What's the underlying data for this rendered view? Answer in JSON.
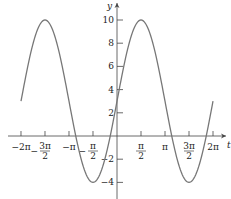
{
  "chart_data": {
    "type": "line",
    "title": "",
    "function": "y = 3 + 7 sin(t)",
    "xlabel": "t",
    "ylabel": "y",
    "xlim": [
      -6.2832,
      6.2832
    ],
    "ylim": [
      -5,
      10.5
    ],
    "grid": false,
    "x_ticks": [
      {
        "value": -6.2832,
        "label": "−2π"
      },
      {
        "value": -4.7124,
        "label": "−3π/2"
      },
      {
        "value": -3.1416,
        "label": "−π"
      },
      {
        "value": -1.5708,
        "label": "−π/2"
      },
      {
        "value": 1.5708,
        "label": "π/2"
      },
      {
        "value": 3.1416,
        "label": "π"
      },
      {
        "value": 4.7124,
        "label": "3π/2"
      },
      {
        "value": 6.2832,
        "label": "2π"
      }
    ],
    "y_ticks": [
      {
        "value": 10,
        "label": "10"
      },
      {
        "value": 8,
        "label": "8"
      },
      {
        "value": 6,
        "label": "6"
      },
      {
        "value": 4,
        "label": "4"
      },
      {
        "value": 2,
        "label": "2"
      },
      {
        "value": -2,
        "label": "−2"
      },
      {
        "value": -4,
        "label": "−4"
      }
    ],
    "series": [
      {
        "name": "y = 3 + 7 sin t",
        "x": [
          -6.2832,
          -4.7124,
          -3.1416,
          -1.5708,
          0,
          1.5708,
          3.1416,
          4.7124,
          6.2832
        ],
        "values": [
          3,
          10,
          3,
          -4,
          3,
          10,
          3,
          -4,
          3
        ]
      }
    ],
    "colors": {
      "curve": "#777777",
      "axis": "#444444"
    }
  },
  "axes": {
    "x_label": "t",
    "y_label": "y"
  }
}
